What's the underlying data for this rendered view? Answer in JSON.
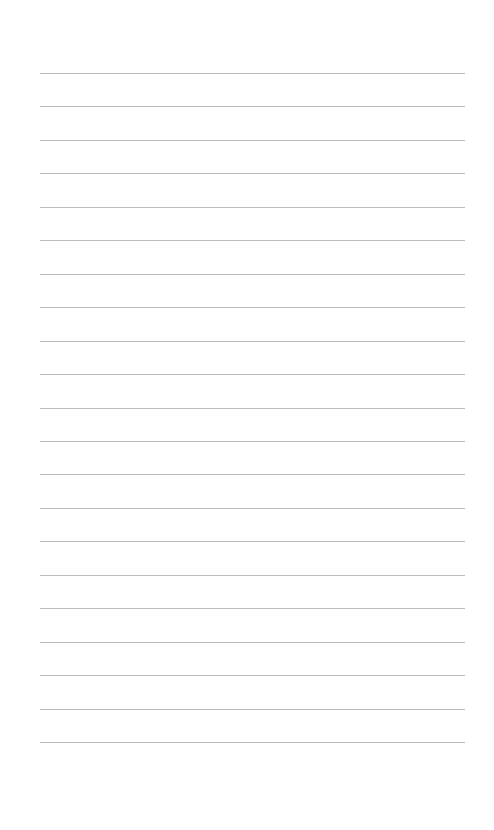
{
  "page": {
    "type": "lined-paper",
    "background_color": "#ffffff",
    "line_color": "#bdbdbd",
    "line_count": 21,
    "first_line_y": 73,
    "line_spacing": 33.45,
    "line_left": 40,
    "line_width": 425
  }
}
